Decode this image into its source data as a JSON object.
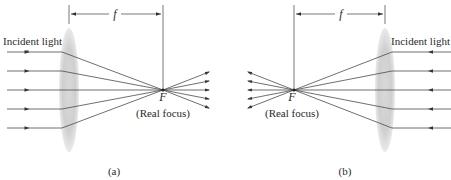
{
  "figure": {
    "panels": [
      {
        "id": "a",
        "caption": "(a)",
        "incident_label": "Incident light",
        "focal_length_label": "f",
        "focus_point_label": "F",
        "focus_description": "(Real focus)",
        "light_direction": "left-to-right",
        "ray_count": 5
      },
      {
        "id": "b",
        "caption": "(b)",
        "incident_label": "Incident light",
        "focal_length_label": "f",
        "focus_point_label": "F",
        "focus_description": "(Real focus)",
        "light_direction": "right-to-left",
        "ray_count": 5
      }
    ]
  }
}
